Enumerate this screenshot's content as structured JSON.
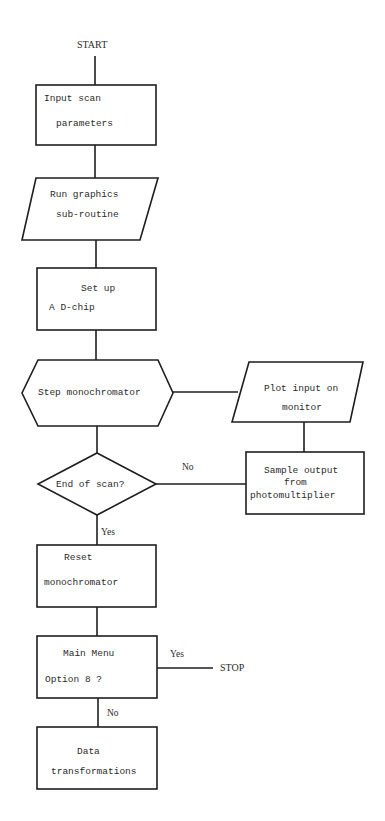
{
  "flowchart": {
    "start_label": "START",
    "stop_label": "STOP",
    "nodes": [
      {
        "id": "input_scan",
        "shape": "process",
        "lines": [
          "Input scan",
          "parameters"
        ]
      },
      {
        "id": "run_graphics",
        "shape": "io",
        "lines": [
          "Run graphics",
          "sub-routine"
        ]
      },
      {
        "id": "setup_ad",
        "shape": "process",
        "lines": [
          "Set up",
          "A D-chip"
        ]
      },
      {
        "id": "step_mono",
        "shape": "preparation",
        "lines": [
          "Step monochromator"
        ]
      },
      {
        "id": "plot_input",
        "shape": "io",
        "lines": [
          "Plot input on",
          "monitor"
        ]
      },
      {
        "id": "sample_output",
        "shape": "process",
        "lines": [
          "Sample output",
          "from",
          "photomultiplier"
        ]
      },
      {
        "id": "end_of_scan",
        "shape": "decision",
        "lines": [
          "End of scan?"
        ]
      },
      {
        "id": "reset_mono",
        "shape": "process",
        "lines": [
          "Reset",
          "monochromator"
        ]
      },
      {
        "id": "main_menu",
        "shape": "process",
        "lines": [
          "Main Menu",
          "Option 8 ?"
        ]
      },
      {
        "id": "data_transform",
        "shape": "process",
        "lines": [
          "Data",
          "transformations"
        ]
      }
    ],
    "edge_labels": {
      "end_scan_no": "No",
      "end_scan_yes": "Yes",
      "menu_yes": "Yes",
      "menu_no": "No"
    },
    "line_color": "#1e1e1e"
  }
}
